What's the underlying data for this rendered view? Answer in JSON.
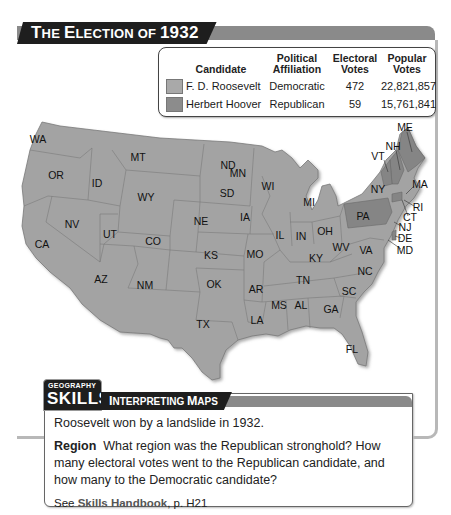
{
  "title": {
    "the": "T",
    "the_rest": "HE ",
    "election": "E",
    "election_rest": "LECTION OF ",
    "year": "1932",
    "full": "The Election of 1932"
  },
  "legend": {
    "headers": {
      "candidate": "Candidate",
      "affiliation_l1": "Political",
      "affiliation_l2": "Affiliation",
      "electoral_l1": "Electoral",
      "electoral_l2": "Votes",
      "popular_l1": "Popular",
      "popular_l2": "Votes"
    },
    "rows": [
      {
        "candidate": "F. D. Roosevelt",
        "affiliation": "Democratic",
        "electoral": "472",
        "popular": "22,821,857",
        "color": "#a9a9a9"
      },
      {
        "candidate": "Herbert Hoover",
        "affiliation": "Republican",
        "electoral": "59",
        "popular": "15,761,841",
        "color": "#8c8c8c"
      }
    ]
  },
  "map": {
    "colors": {
      "democratic": "#a3a3a3",
      "republican": "#858585",
      "border": "#6a6a6a"
    },
    "republican_states": [
      "ME",
      "NH",
      "VT",
      "PA",
      "CT",
      "DE"
    ],
    "labels": [
      {
        "id": "WA",
        "x": 38,
        "y": 140
      },
      {
        "id": "OR",
        "x": 56,
        "y": 176
      },
      {
        "id": "ID",
        "x": 97,
        "y": 184
      },
      {
        "id": "MT",
        "x": 138,
        "y": 158
      },
      {
        "id": "WY",
        "x": 146,
        "y": 198
      },
      {
        "id": "ND",
        "x": 228,
        "y": 166
      },
      {
        "id": "SD",
        "x": 227,
        "y": 194
      },
      {
        "id": "MN",
        "x": 266,
        "y": 175
      },
      {
        "id": "WI",
        "x": 297,
        "y": 188
      },
      {
        "id": "MI",
        "x": 308,
        "y": 204
      },
      {
        "id": "NV",
        "x": 72,
        "y": 225
      },
      {
        "id": "UT",
        "x": 110,
        "y": 235
      },
      {
        "id": "CO",
        "x": 153,
        "y": 242
      },
      {
        "id": "NE",
        "x": 231,
        "y": 222
      },
      {
        "id": "IA",
        "x": 245,
        "y": 218
      },
      {
        "id": "CA",
        "x": 42,
        "y": 245
      },
      {
        "id": "KS",
        "x": 211,
        "y": 256
      },
      {
        "id": "MO",
        "x": 255,
        "y": 255
      },
      {
        "id": "IL",
        "x": 278,
        "y": 236
      },
      {
        "id": "IN",
        "x": 301,
        "y": 237
      },
      {
        "id": "OH",
        "x": 325,
        "y": 232
      },
      {
        "id": "KY",
        "x": 316,
        "y": 259
      },
      {
        "id": "WV",
        "x": 341,
        "y": 248
      },
      {
        "id": "VA",
        "x": 363,
        "y": 251
      },
      {
        "id": "AZ",
        "x": 101,
        "y": 280
      },
      {
        "id": "NM",
        "x": 145,
        "y": 286
      },
      {
        "id": "OK",
        "x": 214,
        "y": 285
      },
      {
        "id": "AR",
        "x": 256,
        "y": 290
      },
      {
        "id": "TN",
        "x": 303,
        "y": 281
      },
      {
        "id": "NC",
        "x": 363,
        "y": 272
      },
      {
        "id": "SC",
        "x": 349,
        "y": 292
      },
      {
        "id": "MS",
        "x": 279,
        "y": 306
      },
      {
        "id": "AL",
        "x": 301,
        "y": 306
      },
      {
        "id": "GA",
        "x": 331,
        "y": 310
      },
      {
        "id": "TX",
        "x": 203,
        "y": 325
      },
      {
        "id": "LA",
        "x": 257,
        "y": 321
      },
      {
        "id": "FL",
        "x": 352,
        "y": 350
      },
      {
        "id": "NY",
        "x": 378,
        "y": 190
      },
      {
        "id": "PA",
        "x": 363,
        "y": 217
      },
      {
        "id": "ME",
        "x": 405,
        "y": 129
      },
      {
        "id": "NH",
        "x": 393,
        "y": 147
      },
      {
        "id": "VT",
        "x": 377,
        "y": 157
      },
      {
        "id": "MA",
        "x": 420,
        "y": 185
      },
      {
        "id": "RI",
        "x": 418,
        "y": 208
      },
      {
        "id": "CT",
        "x": 410,
        "y": 218
      },
      {
        "id": "NJ",
        "x": 405,
        "y": 228
      },
      {
        "id": "DE",
        "x": 404,
        "y": 239
      },
      {
        "id": "MD",
        "x": 404,
        "y": 251
      }
    ]
  },
  "skills": {
    "geography": "GEOGRAPHY",
    "skills": "SKILLS",
    "tab_i": "I",
    "tab_i_rest": "NTERPRETING ",
    "tab_m": "M",
    "tab_m_rest": "APS",
    "intro": "Roosevelt won by a landslide in 1932.",
    "region_label": "Region",
    "question": "What region was the Republican stronghold? How many electoral votes went to the Republican candidate, and how many to the Democratic candidate?",
    "see": "See ",
    "handbook": "Skills Handbook",
    "page": ", p. H21"
  }
}
